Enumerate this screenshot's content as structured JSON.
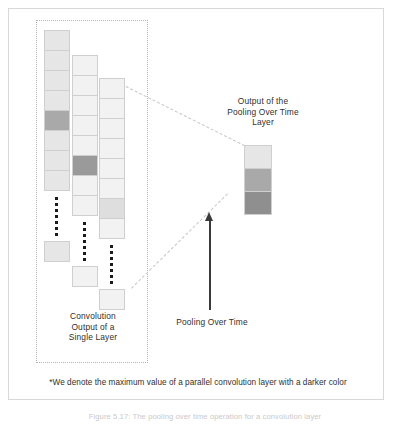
{
  "figure": {
    "type": "diagram",
    "title": "Pooling Over Time Layer",
    "background_color": "#ffffff",
    "frame_color": "#d8d8d8"
  },
  "labels": {
    "output_pooling": "Output of the\nPooling Over Time\nLayer",
    "convolution_output": "Convolution\nOutput of a\nSingle Layer",
    "pooling_over_time": "Pooling Over Time",
    "footnote": "*We denote the maximum value of a parallel convolution layer with a darker color",
    "caption": "Figure 5.17: The pooling over time operation for a convolution layer"
  },
  "palette": {
    "cell_lightest": "#f2f2f2",
    "cell_light": "#e6e6e6",
    "cell_mid": "#dedede",
    "cell_dark": "#a9a9a9",
    "cell_darker": "#9a9a9a",
    "cell_darkest": "#8f8f8f",
    "cell_border": "#cfcfcf",
    "dashed_border": "#b4b4b4",
    "connector": "#c6c6c6",
    "arrow": "#3a3a3a",
    "text": "#2f2f2f"
  },
  "columns": [
    {
      "name": "convolution-column-1",
      "left": 44,
      "top": 30,
      "cell_count": 8,
      "max_index": 4,
      "cells": [
        "light",
        "light",
        "light",
        "light",
        "dark",
        "light",
        "light",
        "light"
      ],
      "ellipsis": true,
      "tail_cell": "light"
    },
    {
      "name": "convolution-column-2",
      "left": 72,
      "top": 55,
      "cell_count": 8,
      "max_index": 5,
      "cells": [
        "lightest",
        "lightest",
        "lightest",
        "lightest",
        "lightest",
        "darker",
        "lightest",
        "lightest"
      ],
      "ellipsis": true,
      "tail_cell": "lightest"
    },
    {
      "name": "convolution-column-3",
      "left": 99,
      "top": 78,
      "cell_count": 8,
      "max_index": 6,
      "cells": [
        "lightest",
        "lightest",
        "lightest",
        "lightest",
        "lightest",
        "lightest",
        "mid",
        "lightest"
      ],
      "ellipsis": true,
      "tail_cell": "lightest"
    }
  ],
  "output_column": {
    "name": "pooling-output-column",
    "left": 244,
    "top": 145,
    "cell_count": 3,
    "cells": [
      "light",
      "dark",
      "darkest"
    ]
  }
}
